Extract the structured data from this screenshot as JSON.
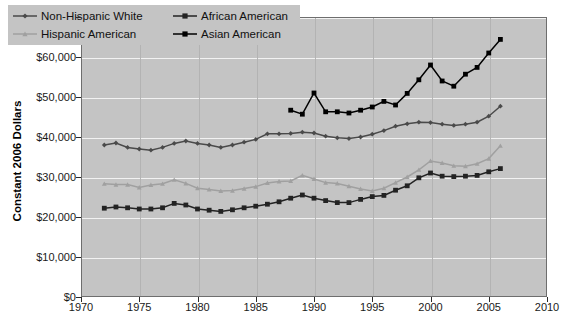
{
  "chart_data": {
    "type": "line",
    "title": "",
    "xlabel": "",
    "ylabel": "Constant 2006 Dollars",
    "xlim": [
      1970,
      2010
    ],
    "ylim": [
      0,
      70000
    ],
    "grid": true,
    "legend_position": "top-left",
    "x_ticks": [
      "1970",
      "1975",
      "1980",
      "1985",
      "1990",
      "1995",
      "2000",
      "2005",
      "2010"
    ],
    "x_tick_values": [
      1970,
      1975,
      1980,
      1985,
      1990,
      1995,
      2000,
      2005,
      2010
    ],
    "y_ticks": [
      "$0",
      "$10,000",
      "$20,000",
      "$30,000",
      "$40,000",
      "$50,000",
      "$60,000",
      "$70,000"
    ],
    "y_tick_values": [
      0,
      10000,
      20000,
      30000,
      40000,
      50000,
      60000,
      70000
    ],
    "series": [
      {
        "name": "Non-Hispanic White",
        "color": "#4a4a4a",
        "marker": "diamond",
        "x": [
          1972,
          1973,
          1974,
          1975,
          1976,
          1977,
          1978,
          1979,
          1980,
          1981,
          1982,
          1983,
          1984,
          1985,
          1986,
          1987,
          1988,
          1989,
          1990,
          1991,
          1992,
          1993,
          1994,
          1995,
          1996,
          1997,
          1998,
          1999,
          2000,
          2001,
          2002,
          2003,
          2004,
          2005,
          2006
        ],
        "values": [
          38000,
          38500,
          37400,
          37000,
          36700,
          37400,
          38400,
          39000,
          38400,
          38000,
          37400,
          38000,
          38700,
          39400,
          40800,
          40800,
          40900,
          41200,
          41000,
          40200,
          39800,
          39600,
          40000,
          40700,
          41600,
          42700,
          43300,
          43700,
          43600,
          43200,
          42900,
          43200,
          43700,
          45200,
          47700
        ]
      },
      {
        "name": "African American",
        "color": "#232323",
        "marker": "square",
        "x": [
          1972,
          1973,
          1974,
          1975,
          1976,
          1977,
          1978,
          1979,
          1980,
          1981,
          1982,
          1983,
          1984,
          1985,
          1986,
          1987,
          1988,
          1989,
          1990,
          1991,
          1992,
          1993,
          1994,
          1995,
          1996,
          1997,
          1998,
          1999,
          2000,
          2001,
          2002,
          2003,
          2004,
          2005,
          2006
        ],
        "values": [
          22200,
          22500,
          22300,
          22000,
          22000,
          22300,
          23400,
          23000,
          22000,
          21700,
          21400,
          21800,
          22300,
          22700,
          23200,
          23800,
          24700,
          25500,
          24700,
          24100,
          23600,
          23600,
          24400,
          25100,
          25400,
          26700,
          27800,
          29800,
          31000,
          30200,
          30100,
          30200,
          30400,
          31300,
          32100
        ]
      },
      {
        "name": "Hispanic American",
        "color": "#a0a0a0",
        "marker": "triangle",
        "x": [
          1972,
          1973,
          1974,
          1975,
          1976,
          1977,
          1978,
          1979,
          1980,
          1981,
          1982,
          1983,
          1984,
          1985,
          1986,
          1987,
          1988,
          1989,
          1990,
          1991,
          1992,
          1993,
          1994,
          1995,
          1996,
          1997,
          1998,
          1999,
          2000,
          2001,
          2002,
          2003,
          2004,
          2005,
          2006
        ],
        "values": [
          28300,
          28100,
          28100,
          27400,
          28000,
          28300,
          29300,
          28400,
          27200,
          26900,
          26500,
          26600,
          27100,
          27600,
          28500,
          28900,
          29000,
          30400,
          29500,
          28600,
          28400,
          27700,
          27000,
          26500,
          27200,
          28600,
          30000,
          31800,
          34000,
          33500,
          32800,
          32700,
          33300,
          34600,
          37800
        ]
      },
      {
        "name": "Asian American",
        "color": "#000000",
        "marker": "square",
        "x": [
          1988,
          1989,
          1990,
          1991,
          1992,
          1993,
          1994,
          1995,
          1996,
          1997,
          1998,
          1999,
          2000,
          2001,
          2002,
          2003,
          2004,
          2005,
          2006
        ],
        "values": [
          46700,
          45700,
          51000,
          46300,
          46300,
          46000,
          46700,
          47500,
          48900,
          48000,
          50900,
          54300,
          58000,
          54000,
          52700,
          55700,
          57400,
          61000,
          64400
        ]
      }
    ]
  },
  "legend": {
    "entries": [
      {
        "label": "Non-Hispanic White"
      },
      {
        "label": "African American"
      },
      {
        "label": "Hispanic American"
      },
      {
        "label": "Asian American"
      }
    ]
  }
}
